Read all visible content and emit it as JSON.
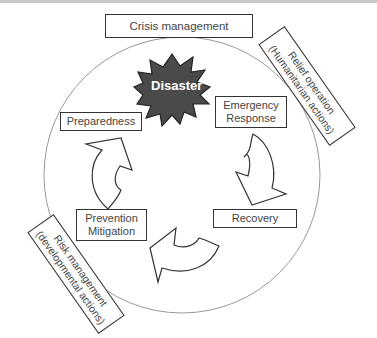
{
  "diagram": {
    "title": "Crisis management",
    "center_event": "Disaster",
    "phases": [
      {
        "label_line1": "Emergency",
        "label_line2": "Response"
      },
      {
        "label_line1": "Recovery",
        "label_line2": ""
      },
      {
        "label_line1": "Prevention",
        "label_line2": "Mitigation"
      },
      {
        "label_line1": "Preparedness",
        "label_line2": ""
      }
    ],
    "side_labels": {
      "relief": {
        "line1": "Relief operation",
        "line2": "(Humanitarian actions)"
      },
      "risk": {
        "line1": "Risk management",
        "line2": "(developmental actions)"
      }
    },
    "colors": {
      "starburst": "#4a4a4a",
      "circle": "#999999",
      "stroke": "#333333"
    }
  }
}
